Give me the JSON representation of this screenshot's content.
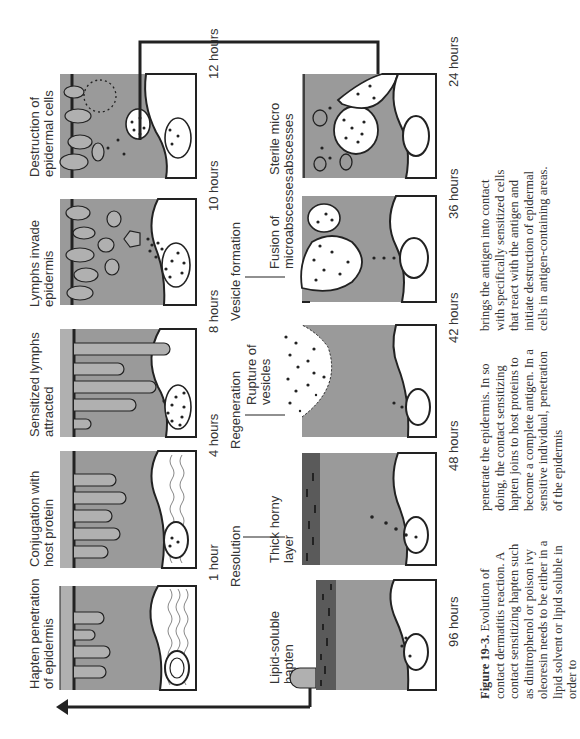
{
  "figure": {
    "number_label": "Figure 19-3.",
    "caption_col1": "Evolution of contact dermatitis reaction. A contact sensitizing hapten such as dinitrophenol or poison ivy oleoresin needs to be either in a lipid solvent or lipid soluble in order to",
    "caption_col2": "penetrate the epidermis. In so doing, the contact sensitizing hapten joins to host proteins to become a complete antigen. In a sensitive individual, penetration of the epidermis",
    "caption_col3": "brings the antigen into contact with specifically sensitized cells that react with the antigen and initiate destruction of epidermal cells in antigen-containing areas."
  },
  "top_row": [
    {
      "label_line1": "Hapten penetration",
      "label_line2": "of epidermis",
      "time": "1 hour"
    },
    {
      "label_line1": "Conjugation with",
      "label_line2": "host protein",
      "time": "4 hours"
    },
    {
      "label_line1": "Sensitized lymphs",
      "label_line2": "attracted",
      "time": "8 hours"
    },
    {
      "label_line1": "Lymphs invade",
      "label_line2": "epidermis",
      "time": "10 hours"
    },
    {
      "label_line1": "Destruction of",
      "label_line2": "epidermal cells",
      "time": "12 hours"
    }
  ],
  "bottom_row": [
    {
      "label_line1": "Lipid-soluble",
      "label_line2": "hapten",
      "time": "96 hours"
    },
    {
      "label_line1": "Thick horny",
      "label_line2": "layer",
      "time": "48 hours"
    },
    {
      "label_line1": "Rupture of",
      "label_line2": "vesicles",
      "time": "42 hours"
    },
    {
      "label_line1": "Fusion of",
      "label_line2": "microabscesses",
      "time": "36 hours"
    },
    {
      "label_line1": "Sterile micro",
      "label_line2": "abscesses",
      "time": "24 hours"
    }
  ],
  "stages": {
    "resolution": "Resolution",
    "regeneration": "Regeneration",
    "vesicle_formation": "Vesicle formation"
  },
  "colors": {
    "epidermis": "#9a9a9a",
    "horny_layer": "#b4b4b4",
    "vesicle": "#ffffff",
    "line": "#222222"
  }
}
